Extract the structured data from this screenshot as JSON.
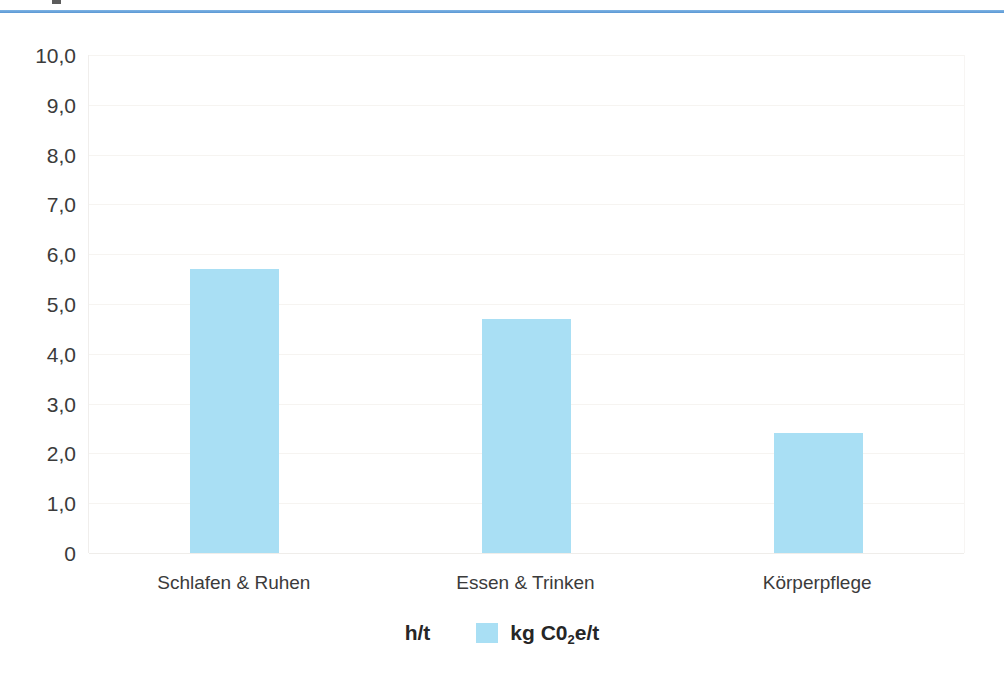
{
  "page": {
    "background_color": "#ffffff",
    "rule_color": "#5a97d4"
  },
  "chart_data": {
    "type": "bar",
    "title": "",
    "subtitle": "",
    "xlabel": "",
    "ylabel": "",
    "categories": [
      "Schlafen & Ruhen",
      "Essen & Trinken",
      "Körperpflege"
    ],
    "series": [
      {
        "name": "h/t",
        "values": [
          0,
          0,
          0
        ],
        "color": "#7ec8e8",
        "visible": false
      },
      {
        "name": "kg C0₂e/t",
        "values": [
          5.7,
          4.7,
          2.4
        ],
        "color": "#a9dff4",
        "visible": true
      }
    ],
    "ylim": [
      0,
      10
    ],
    "ytick_step": 1,
    "ytick_labels": [
      "10,0",
      "9,0",
      "8,0",
      "7,0",
      "6,0",
      "5,0",
      "4,0",
      "3,0",
      "2,0",
      "1,0",
      "0"
    ],
    "ytick_values": [
      10,
      9,
      8,
      7,
      6,
      5,
      4,
      3,
      2,
      1,
      0
    ],
    "grid": true,
    "grid_color": "#f6f4f1",
    "legend_position": "bottom",
    "decimal_separator": ","
  },
  "legend": {
    "entries": [
      {
        "label": "h/t",
        "label_plain": "h/t",
        "swatch": false,
        "color": "#7ec8e8"
      },
      {
        "label_prefix": "kg C0",
        "label_sub": "2",
        "label_suffix": "e/t",
        "label_plain": "kg C0₂e/t",
        "swatch": true,
        "color": "#a9dff4"
      }
    ]
  }
}
